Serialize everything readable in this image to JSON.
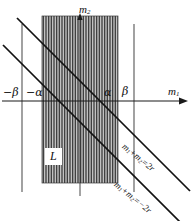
{
  "figure": {
    "name": "region-L-diagram",
    "background_color": "#ffffff",
    "ink_color": "#111111",
    "hatch_color": "#2b2b2b"
  },
  "axes": {
    "horizontal": {
      "label": "m",
      "subscript": "1",
      "arrow": "right",
      "y_px": 101,
      "x_start_px": 2,
      "x_end_px": 188
    },
    "vertical": {
      "label": "m",
      "subscript": "2",
      "arrow": "up",
      "x_px": 80,
      "y_top_px": 14,
      "y_bottom_px": 196
    }
  },
  "tick_labels": [
    {
      "name": "neg-beta",
      "text": "−β",
      "x_px": 22,
      "side": "left"
    },
    {
      "name": "neg-alpha",
      "text": "−α",
      "x_px": 42,
      "side": "left"
    },
    {
      "name": "alpha",
      "text": "α",
      "x_px": 118,
      "side": "right"
    },
    {
      "name": "beta",
      "text": "β",
      "x_px": 134,
      "side": "right"
    }
  ],
  "vertical_boundary_lines": [
    {
      "name": "line-neg-beta",
      "x_px": 22,
      "y1_px": 24,
      "y2_px": 192
    },
    {
      "name": "line-beta",
      "x_px": 134,
      "y1_px": 24,
      "y2_px": 192
    }
  ],
  "hatched_rect": {
    "label": "L",
    "x_px": 42,
    "y_px": 16,
    "width_px": 76,
    "height_px": 167,
    "hatch_direction": "vertical",
    "hatch_spacing_px": 1.6
  },
  "diagonal_band": {
    "slope": -1,
    "upper_line": {
      "name": "line-sum-pos-2r",
      "equation": "m₁+m₂=2r",
      "label_parts": {
        "m1": "m",
        "sub1": "1",
        "plus": "+",
        "m2": "m",
        "sub2": "2",
        "eq": "=2r"
      },
      "x1_px": 17,
      "y1_px": 18,
      "x2_px": 188,
      "y2_px": 189
    },
    "lower_line": {
      "name": "line-sum-neg-2r",
      "equation": "m₁+m₂=−2r",
      "label_parts": {
        "m1": "m",
        "sub1": "1",
        "plus": "+",
        "m2": "m",
        "sub2": "2",
        "eq": "=−2r"
      },
      "x1_px": 4,
      "y1_px": 46,
      "x2_px": 180,
      "y2_px": 222
    }
  },
  "labels": {
    "region": "L",
    "m1_base": "m",
    "m1_sub": "1",
    "m2_base": "m",
    "m2_sub": "2",
    "neg_beta": "−β",
    "neg_alpha": "−α",
    "alpha": "α",
    "beta": "β",
    "eq_pos_m1": "m",
    "eq_pos_s1": "1",
    "eq_pos_plus": "+",
    "eq_pos_m2": "m",
    "eq_pos_s2": "2",
    "eq_pos_tail": "=2r",
    "eq_neg_m1": "m",
    "eq_neg_s1": "1",
    "eq_neg_plus": "+",
    "eq_neg_m2": "m",
    "eq_neg_s2": "2",
    "eq_neg_tail": "=−2r"
  }
}
